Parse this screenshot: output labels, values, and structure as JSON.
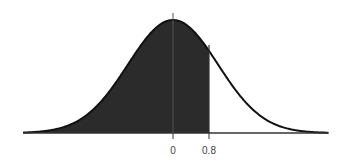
{
  "chart_data": {
    "type": "area",
    "title": "",
    "xlabel": "",
    "ylabel": "",
    "x_ticks": [
      {
        "value": 0,
        "label": "0"
      },
      {
        "value": 0.8,
        "label": "0.8"
      }
    ],
    "distribution": {
      "name": "normal",
      "mean": 0,
      "sd": 1
    },
    "shaded_region": {
      "from": "-inf",
      "to": 0.8,
      "side": "left"
    },
    "xlim": [
      -3.33,
      3.46
    ],
    "grid": false,
    "legend": null,
    "colors": {
      "fill": "#2b2b2b",
      "curve": "#111111",
      "axis": "#333333",
      "background": "#ffffff"
    }
  }
}
